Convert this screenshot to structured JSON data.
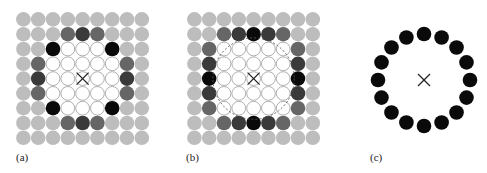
{
  "figure": {
    "panels": [
      {
        "id": "a",
        "label": "(a)",
        "origin": [
          16,
          12
        ],
        "grid_size": 9,
        "center_marker": "×",
        "highlighted": [
          {
            "row": 1,
            "col": 3,
            "shade": "mid"
          },
          {
            "row": 1,
            "col": 4,
            "shade": "dark"
          },
          {
            "row": 1,
            "col": 5,
            "shade": "mid"
          },
          {
            "row": 2,
            "col": 2,
            "shade": "black"
          },
          {
            "row": 2,
            "col": 6,
            "shade": "black"
          },
          {
            "row": 3,
            "col": 1,
            "shade": "mid"
          },
          {
            "row": 3,
            "col": 7,
            "shade": "mid"
          },
          {
            "row": 4,
            "col": 1,
            "shade": "dark"
          },
          {
            "row": 4,
            "col": 7,
            "shade": "dark"
          },
          {
            "row": 5,
            "col": 1,
            "shade": "mid"
          },
          {
            "row": 5,
            "col": 7,
            "shade": "mid"
          },
          {
            "row": 6,
            "col": 2,
            "shade": "black"
          },
          {
            "row": 6,
            "col": 6,
            "shade": "black"
          },
          {
            "row": 7,
            "col": 3,
            "shade": "mid"
          },
          {
            "row": 7,
            "col": 4,
            "shade": "dark"
          },
          {
            "row": 7,
            "col": 5,
            "shade": "mid"
          }
        ],
        "white": [
          [
            2,
            3
          ],
          [
            2,
            4
          ],
          [
            2,
            5
          ],
          [
            3,
            2
          ],
          [
            3,
            3
          ],
          [
            3,
            4
          ],
          [
            3,
            5
          ],
          [
            3,
            6
          ],
          [
            4,
            2
          ],
          [
            4,
            3
          ],
          [
            4,
            4
          ],
          [
            4,
            5
          ],
          [
            4,
            6
          ],
          [
            5,
            2
          ],
          [
            5,
            3
          ],
          [
            5,
            4
          ],
          [
            5,
            5
          ],
          [
            5,
            6
          ],
          [
            6,
            3
          ],
          [
            6,
            4
          ],
          [
            6,
            5
          ]
        ],
        "dashed_circle": false
      },
      {
        "id": "b",
        "label": "(b)",
        "origin": [
          187,
          12
        ],
        "grid_size": 9,
        "center_marker": "×",
        "highlighted": [
          {
            "row": 1,
            "col": 2,
            "shade": "mid"
          },
          {
            "row": 1,
            "col": 3,
            "shade": "dark"
          },
          {
            "row": 1,
            "col": 4,
            "shade": "black"
          },
          {
            "row": 1,
            "col": 5,
            "shade": "dark"
          },
          {
            "row": 1,
            "col": 6,
            "shade": "mid"
          },
          {
            "row": 2,
            "col": 1,
            "shade": "mid"
          },
          {
            "row": 2,
            "col": 7,
            "shade": "mid"
          },
          {
            "row": 3,
            "col": 1,
            "shade": "dark"
          },
          {
            "row": 3,
            "col": 7,
            "shade": "dark"
          },
          {
            "row": 4,
            "col": 1,
            "shade": "black"
          },
          {
            "row": 4,
            "col": 7,
            "shade": "black"
          },
          {
            "row": 5,
            "col": 1,
            "shade": "dark"
          },
          {
            "row": 5,
            "col": 7,
            "shade": "dark"
          },
          {
            "row": 6,
            "col": 1,
            "shade": "mid"
          },
          {
            "row": 6,
            "col": 7,
            "shade": "mid"
          },
          {
            "row": 7,
            "col": 2,
            "shade": "mid"
          },
          {
            "row": 7,
            "col": 3,
            "shade": "dark"
          },
          {
            "row": 7,
            "col": 4,
            "shade": "black"
          },
          {
            "row": 7,
            "col": 5,
            "shade": "dark"
          },
          {
            "row": 7,
            "col": 6,
            "shade": "mid"
          }
        ],
        "white": [
          [
            2,
            2
          ],
          [
            2,
            3
          ],
          [
            2,
            4
          ],
          [
            2,
            5
          ],
          [
            2,
            6
          ],
          [
            3,
            2
          ],
          [
            3,
            3
          ],
          [
            3,
            4
          ],
          [
            3,
            5
          ],
          [
            3,
            6
          ],
          [
            4,
            2
          ],
          [
            4,
            3
          ],
          [
            4,
            4
          ],
          [
            4,
            5
          ],
          [
            4,
            6
          ],
          [
            5,
            2
          ],
          [
            5,
            3
          ],
          [
            5,
            4
          ],
          [
            5,
            5
          ],
          [
            5,
            6
          ],
          [
            6,
            2
          ],
          [
            6,
            3
          ],
          [
            6,
            4
          ],
          [
            6,
            5
          ],
          [
            6,
            6
          ]
        ],
        "dashed_circle": true
      },
      {
        "id": "c",
        "label": "(c)",
        "center": [
          424,
          80
        ],
        "ring_count": 16,
        "ring_radius": 46,
        "center_marker": "×"
      }
    ],
    "colors": {
      "background_circle": "#bdbdbd",
      "mid": "#666666",
      "dark": "#3a3a3a",
      "black": "#0a0a0a",
      "white_fill": "#ffffff",
      "white_stroke": "#9a9a9a",
      "marker": "#222222"
    },
    "pitch": 14.8,
    "circle_radius": 7.3
  }
}
